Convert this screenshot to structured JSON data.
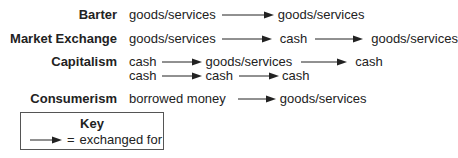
{
  "rows": {
    "barter": {
      "label": "Barter",
      "terms": [
        "goods/services",
        "goods/services"
      ]
    },
    "market_exchange": {
      "label": "Market Exchange",
      "terms": [
        "goods/services",
        "cash",
        "goods/services"
      ]
    },
    "capitalism": {
      "label": "Capitalism",
      "line1": [
        "cash",
        "goods/services",
        "cash"
      ],
      "line2": [
        "cash",
        "cash",
        "cash"
      ]
    },
    "consumerism": {
      "label": "Consumerism",
      "terms": [
        "borrowed money",
        "goods/services"
      ]
    }
  },
  "key": {
    "title": "Key",
    "equals": "=",
    "meaning": "exchanged for",
    "symbol": "right-arrow-icon"
  },
  "colors": {
    "text": "#222222",
    "arrow": "#222222",
    "key_border": "#555555"
  }
}
